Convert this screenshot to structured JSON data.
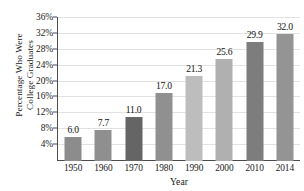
{
  "chart_data": {
    "type": "bar",
    "title": "",
    "xlabel": "Year",
    "ylabel": "Percentage Who Were College Graduates",
    "ylabel_lines": [
      "Percentage Who Were",
      "College Graduates"
    ],
    "categories": [
      "1950",
      "1960",
      "1970",
      "1980",
      "1990",
      "2000",
      "2010",
      "2014"
    ],
    "values": [
      6.0,
      7.7,
      11.0,
      17.0,
      21.3,
      25.6,
      29.9,
      32.0
    ],
    "data_labels": [
      "6.0",
      "7.7",
      "11.0",
      "17.0",
      "21.3",
      "25.6",
      "29.9",
      "32.0"
    ],
    "ylim": [
      0,
      36
    ],
    "ytick_values": [
      4,
      8,
      12,
      16,
      20,
      24,
      28,
      32,
      36
    ],
    "ytick_labels": [
      "4%",
      "8%",
      "12%",
      "16%",
      "20%",
      "24%",
      "28%",
      "32%",
      "36%"
    ],
    "grid": true,
    "grid_axis": "y",
    "legend": false,
    "bar_colors": [
      "#8c8c8c",
      "#8f8f8f",
      "#656565",
      "#909090",
      "#bdbdbd",
      "#b0b0b0",
      "#7d7d7d",
      "#949494"
    ],
    "axis_color": "#4b4b4b",
    "gridline_color": "#e2e2e2",
    "background": "#ffffff"
  }
}
